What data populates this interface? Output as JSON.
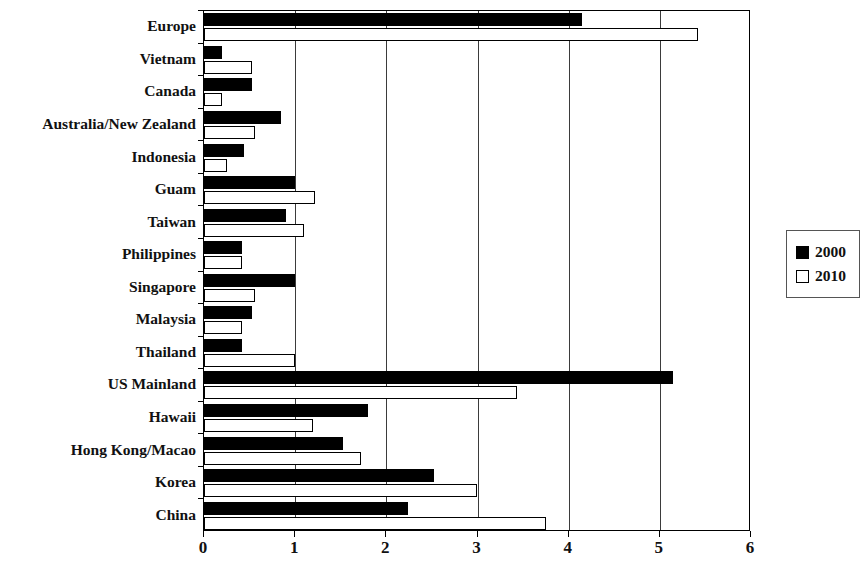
{
  "chart_data": {
    "type": "bar",
    "orientation": "horizontal",
    "title": "",
    "subtitle": "",
    "xlabel": "",
    "ylabel": "",
    "xlim": [
      0,
      6
    ],
    "xticks": [
      "0",
      "1",
      "2",
      "3",
      "4",
      "5",
      "6"
    ],
    "grid": "vertical",
    "legend_position": "right",
    "categories": [
      "Europe",
      "Vietnam",
      "Canada",
      "Australia/New Zealand",
      "Indonesia",
      "Guam",
      "Taiwan",
      "Philippines",
      "Singapore",
      "Malaysia",
      "Thailand",
      "US Mainland",
      "Hawaii",
      "Hong Kong/Macao",
      "Korea",
      "China"
    ],
    "series": [
      {
        "name": "2000",
        "color": "#000000",
        "style": "filled",
        "values": [
          4.15,
          0.2,
          0.53,
          0.85,
          0.44,
          1.0,
          0.9,
          0.42,
          1.0,
          0.53,
          0.42,
          5.14,
          1.8,
          1.53,
          2.52,
          2.24
        ]
      },
      {
        "name": "2010",
        "color": "#ffffff",
        "style": "outlined",
        "values": [
          5.42,
          0.53,
          0.2,
          0.56,
          0.25,
          1.22,
          1.1,
          0.42,
          0.56,
          0.42,
          1.0,
          3.43,
          1.2,
          1.72,
          2.99,
          3.75
        ]
      }
    ]
  },
  "legend": {
    "items": [
      {
        "label": "2000",
        "swatch": "filled-square-icon"
      },
      {
        "label": "2010",
        "swatch": "open-square-icon"
      }
    ]
  }
}
